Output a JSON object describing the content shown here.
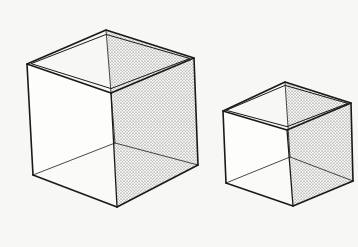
{
  "image": {
    "description": "Line drawing of two open-top transparent cubes in isometric view with stippled interior faces",
    "width": 358,
    "height": 247,
    "background_color": "#f7f7f5",
    "line_color": "#1a1a1a",
    "stipple_color": "#555555"
  },
  "objects": [
    {
      "name": "large-cube",
      "vertices": {
        "top_left": [
          27,
          64
        ],
        "top_back": [
          106,
          30
        ],
        "top_right": [
          194,
          58
        ],
        "top_front": [
          111,
          93
        ],
        "bottom_left": [
          33,
          175
        ],
        "bottom_front": [
          117,
          207
        ],
        "bottom_right": [
          198,
          165
        ],
        "bottom_back": [
          115,
          143
        ]
      }
    },
    {
      "name": "small-cube",
      "vertices": {
        "top_left": [
          223,
          111
        ],
        "top_back": [
          285,
          82
        ],
        "top_right": [
          351,
          103
        ],
        "top_front": [
          287,
          130
        ],
        "bottom_left": [
          226,
          183
        ],
        "bottom_front": [
          293,
          206
        ],
        "bottom_right": [
          353,
          181
        ],
        "bottom_back": [
          290,
          157
        ]
      }
    }
  ]
}
